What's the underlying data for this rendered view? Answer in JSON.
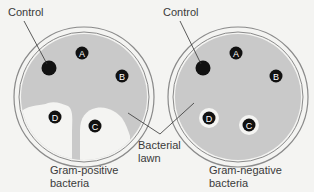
{
  "labels": {
    "control_left": "Control",
    "control_right": "Control",
    "lawn_line1": "Bacterial",
    "lawn_line2": "lawn",
    "left_caption_line1": "Gram-positive",
    "left_caption_line2": "bacteria",
    "right_caption_line1": "Gram-negative",
    "right_caption_line2": "bacteria"
  },
  "disks": {
    "a": "A",
    "b": "B",
    "c": "C",
    "d": "D"
  },
  "colors": {
    "lawn": "#c9c9c9",
    "clear_zone": "#f4f4f2",
    "disk": "#111111",
    "plate_rim": "#8a8a8a"
  }
}
